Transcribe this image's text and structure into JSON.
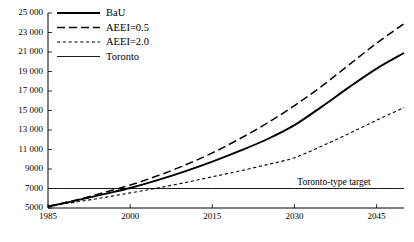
{
  "chart_data": {
    "type": "line",
    "title": "",
    "subtitle": "",
    "xlabel": "",
    "ylabel": "",
    "xlim": [
      1985,
      2050
    ],
    "ylim": [
      5000,
      25000
    ],
    "grid": false,
    "legend_position": "top-left",
    "x_ticks": [
      "1985",
      "2000",
      "2015",
      "2030",
      "2045"
    ],
    "x_tick_values": [
      1985,
      2000,
      2015,
      2030,
      2045
    ],
    "y_ticks": [
      "5000",
      "7000",
      "9000",
      "11 000",
      "13 000",
      "15 000",
      "17 000",
      "19 000",
      "21 000",
      "23 000",
      "25 000"
    ],
    "y_tick_values": [
      5000,
      7000,
      9000,
      11000,
      13000,
      15000,
      17000,
      19000,
      21000,
      23000,
      25000
    ],
    "x": [
      1985,
      1990,
      1995,
      2000,
      2005,
      2010,
      2015,
      2020,
      2025,
      2030,
      2035,
      2040,
      2045,
      2050
    ],
    "series": [
      {
        "name": "BaU",
        "style": "solid",
        "width": 1.9,
        "color": "#000000",
        "values": [
          5150,
          5750,
          6400,
          7050,
          7850,
          8750,
          9750,
          10850,
          12050,
          13500,
          15400,
          17400,
          19300,
          20900
        ]
      },
      {
        "name": "AEEI=0.5",
        "style": "long-dash",
        "width": 1.5,
        "color": "#000000",
        "values": [
          5150,
          5800,
          6550,
          7350,
          8300,
          9400,
          10650,
          12100,
          13700,
          15500,
          17500,
          19700,
          21900,
          23900
        ]
      },
      {
        "name": "AEEI=2.0",
        "style": "short-dash",
        "width": 1.1,
        "color": "#000000",
        "values": [
          5150,
          5600,
          6050,
          6550,
          7050,
          7600,
          8200,
          8800,
          9450,
          10150,
          11350,
          12650,
          14000,
          15300
        ]
      },
      {
        "name": "Toronto",
        "style": "solid",
        "width": 0.9,
        "color": "#000000",
        "values": [
          7000,
          7000,
          7000,
          7000,
          7000,
          7000,
          7000,
          7000,
          7000,
          7000,
          7000,
          7000,
          7000,
          7000
        ]
      }
    ],
    "annotations": [
      {
        "name": "toronto-type-target",
        "text": "Toronto-type target",
        "x": 2036,
        "y": 7550
      }
    ]
  },
  "legend": {
    "entries": [
      {
        "label": "BaU",
        "style": "solid"
      },
      {
        "label": "AEEI=0.5",
        "style": "long-dash"
      },
      {
        "label": "AEEI=2.0",
        "style": "short-dash"
      },
      {
        "label": "Toronto",
        "style": "solid"
      }
    ]
  }
}
